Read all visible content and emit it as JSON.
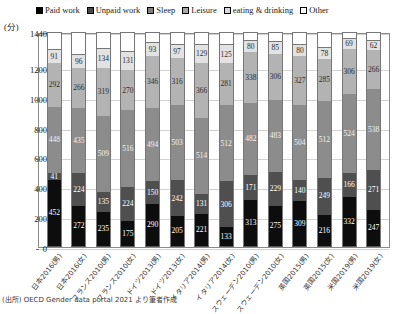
{
  "chart": {
    "unit_label": "(分)",
    "source_note": "(出所) OECD Gender data portal 2021 より筆者作成"
  },
  "legend": {
    "items": [
      {
        "label": "Paid work",
        "icon": "square-filled-black-icon",
        "color": "#0d0d0d"
      },
      {
        "label": "Unpaid work",
        "icon": "square-filled-darkgray-icon",
        "color": "#4f4f4f"
      },
      {
        "label": "Sleep",
        "icon": "square-filled-gray-icon",
        "color": "#8c8c8c"
      },
      {
        "label": "Leisure",
        "icon": "square-filled-lightgray-icon",
        "color": "#b3b3b3"
      },
      {
        "label": "eating & drinking",
        "icon": "square-filled-paleg-icon",
        "color": "#e2e2e2"
      },
      {
        "label": "Other",
        "icon": "square-outline-icon",
        "color": "#ffffff"
      }
    ]
  },
  "chart_data": {
    "type": "bar",
    "stacked": true,
    "title": "",
    "xlabel": "",
    "ylabel": "(分)",
    "ylim": [
      0,
      1440
    ],
    "yticks": [
      0,
      200,
      400,
      600,
      800,
      1000,
      1200,
      1440
    ],
    "grid": true,
    "legend_position": "top",
    "categories": [
      "日本2016(男)",
      "日本2016(女)",
      "フランス2010(男)",
      "フランス2010(女)",
      "ドイツ2013(男)",
      "ドイツ2013(女)",
      "イタリア2014(男)",
      "イタリア2014(女)",
      "スウェーデン2010(男)",
      "スウェーデン2010(女)",
      "英国2015(男)",
      "英国2015(女)",
      "米国2019(男)",
      "米国2019(女)"
    ],
    "series": [
      {
        "name": "Paid work",
        "values": [
          452,
          272,
          235,
          175,
          290,
          205,
          221,
          133,
          313,
          275,
          309,
          216,
          332,
          247
        ]
      },
      {
        "name": "Unpaid work",
        "values": [
          41,
          224,
          135,
          224,
          150,
          242,
          131,
          306,
          171,
          229,
          140,
          249,
          166,
          271
        ]
      },
      {
        "name": "Sleep",
        "values": [
          448,
          435,
          509,
          516,
          494,
          503,
          514,
          512,
          482,
          483,
          504,
          512,
          524,
          538
        ]
      },
      {
        "name": "Leisure",
        "values": [
          292,
          266,
          319,
          270,
          346,
          316,
          366,
          281,
          338,
          306,
          327,
          285,
          306,
          266
        ]
      },
      {
        "name": "eating & drinking",
        "values": [
          91,
          96,
          134,
          131,
          93,
          97,
          129,
          125,
          80,
          85,
          80,
          78,
          69,
          62
        ]
      }
    ],
    "other_series_name": "Other",
    "total": 1440
  }
}
